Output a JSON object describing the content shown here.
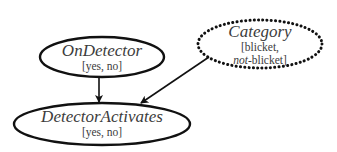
{
  "diagram": {
    "type": "causal-graph",
    "nodes": [
      {
        "id": "on_detector",
        "title": "OnDetector",
        "values_text": "[yes, no]",
        "values": [
          "yes",
          "no"
        ],
        "border": "solid",
        "center": [
          102,
          57
        ],
        "rx": 62,
        "ry": 20
      },
      {
        "id": "category",
        "title": "Category",
        "values_line1": "[blicket,",
        "values_line2_italic": "not",
        "values_line2_rest": "-blicket]",
        "values": [
          "blicket",
          "not-blicket"
        ],
        "border": "dotted",
        "center": [
          260,
          44
        ],
        "rx": 62,
        "ry": 24
      },
      {
        "id": "detector_activates",
        "title": "DetectorActivates",
        "values_text": "[yes, no]",
        "values": [
          "yes",
          "no"
        ],
        "border": "solid",
        "center": [
          102,
          124
        ],
        "rx": 88,
        "ry": 21
      }
    ],
    "edges": [
      {
        "from": "on_detector",
        "to": "detector_activates"
      },
      {
        "from": "category",
        "to": "detector_activates"
      }
    ],
    "colors": {
      "stroke": "#111111",
      "text": "#3c3c3c",
      "background": "#ffffff"
    }
  }
}
